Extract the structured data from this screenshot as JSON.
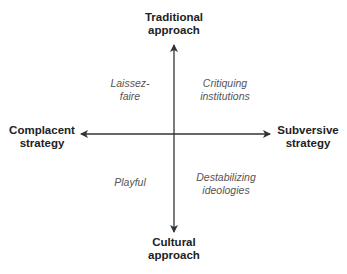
{
  "diagram": {
    "type": "quadrant",
    "axes": {
      "top": [
        "Traditional",
        "approach"
      ],
      "bottom": [
        "Cultural",
        "approach"
      ],
      "left": [
        "Complacent",
        "strategy"
      ],
      "right": [
        "Subversive",
        "strategy"
      ]
    },
    "quadrants": {
      "top_left": [
        "Laissez-",
        "faire"
      ],
      "top_right": [
        "Critiquing",
        "institutions"
      ],
      "bottom_left": [
        "Playful"
      ],
      "bottom_right": [
        "Destabilizing",
        "ideologies"
      ]
    },
    "colors": {
      "axis": "#333333",
      "label": "#222222",
      "quadrant_text": "#555555"
    }
  }
}
